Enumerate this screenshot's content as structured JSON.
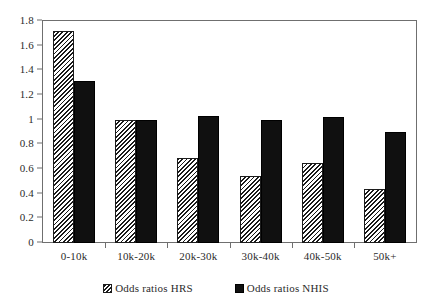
{
  "chart_data": {
    "type": "bar",
    "title": "",
    "subtitle": "",
    "xlabel": "",
    "ylabel": "",
    "categories": [
      "0-10k",
      "10k-20k",
      "20k-30k",
      "30k-40k",
      "40k-50k",
      "50k+"
    ],
    "series": [
      {
        "name": "Odds ratios HRS",
        "values": [
          1.72,
          1.0,
          0.69,
          0.54,
          0.65,
          0.44
        ],
        "fill": "hatched-diagonal",
        "color": "#d9d9d9"
      },
      {
        "name": "Odds ratios NHIS",
        "values": [
          1.31,
          1.0,
          1.03,
          1.0,
          1.02,
          0.9
        ],
        "fill": "solid",
        "color": "#101010"
      }
    ],
    "ylim": [
      0,
      1.8
    ],
    "ytick_labels": [
      "0",
      "0.2",
      "0.4",
      "0.6",
      "0.8",
      "1",
      "1.2",
      "1.4",
      "1.6",
      "1.8"
    ],
    "ytick_values": [
      0,
      0.2,
      0.4,
      0.6,
      0.8,
      1,
      1.2,
      1.4,
      1.6,
      1.8
    ],
    "grid": false,
    "legend_position": "bottom",
    "frame": true,
    "annotations": []
  },
  "legend": {
    "items": [
      {
        "label": "Odds ratios HRS"
      },
      {
        "label": "Odds ratios NHIS"
      }
    ]
  },
  "colors": {
    "axis": "#6f6f6f",
    "text": "#2b2b2b",
    "series_hrs": "#d9d9d9",
    "series_nhis": "#101010",
    "background": "#ffffff"
  }
}
